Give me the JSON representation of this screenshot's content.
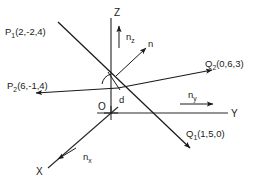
{
  "diagram": {
    "background_color": "#ffffff",
    "ink_color": "#1a1a1a",
    "axes": {
      "x_label": "X",
      "y_label": "Y",
      "z_label": "Z",
      "origin_label": "O"
    },
    "unit_vectors": [
      {
        "base": "n",
        "sub": "x",
        "direction": "down-left along X axis"
      },
      {
        "base": "n",
        "sub": "y",
        "direction": "right along Y axis"
      },
      {
        "base": "n",
        "sub": "z",
        "direction": "up along Z axis"
      }
    ],
    "normal_vector": {
      "label": "n",
      "direction": "up-right from intersection region"
    },
    "distance_label": "d",
    "points": [
      {
        "name": "P",
        "sub": "1",
        "coords": "(2,-2,4)"
      },
      {
        "name": "P",
        "sub": "2",
        "coords": "(6,-1,4)"
      },
      {
        "name": "Q",
        "sub": "1",
        "coords": "(1,5,0)"
      },
      {
        "name": "Q",
        "sub": "2",
        "coords": "(0,6,3)"
      }
    ],
    "lines": [
      {
        "name": "line-P1-Q1",
        "from": "P1(2,-2,4)",
        "to": "Q1(1,5,0)"
      },
      {
        "name": "line-P2-Q2",
        "from": "P2(6,-1,4)",
        "to": "Q2(0,6,3)"
      }
    ]
  }
}
